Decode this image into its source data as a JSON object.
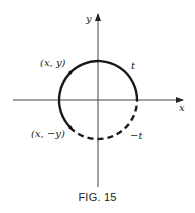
{
  "figure": {
    "caption": "FIG. 15",
    "axis_labels": {
      "x": "x",
      "y": "y"
    },
    "points": [
      {
        "label": "(x, y)"
      },
      {
        "label": "(x, −y)"
      }
    ],
    "arc_labels": {
      "positive": "t",
      "negative": "−t"
    },
    "colors": {
      "ink": "#222222",
      "background": "#ffffff"
    }
  }
}
